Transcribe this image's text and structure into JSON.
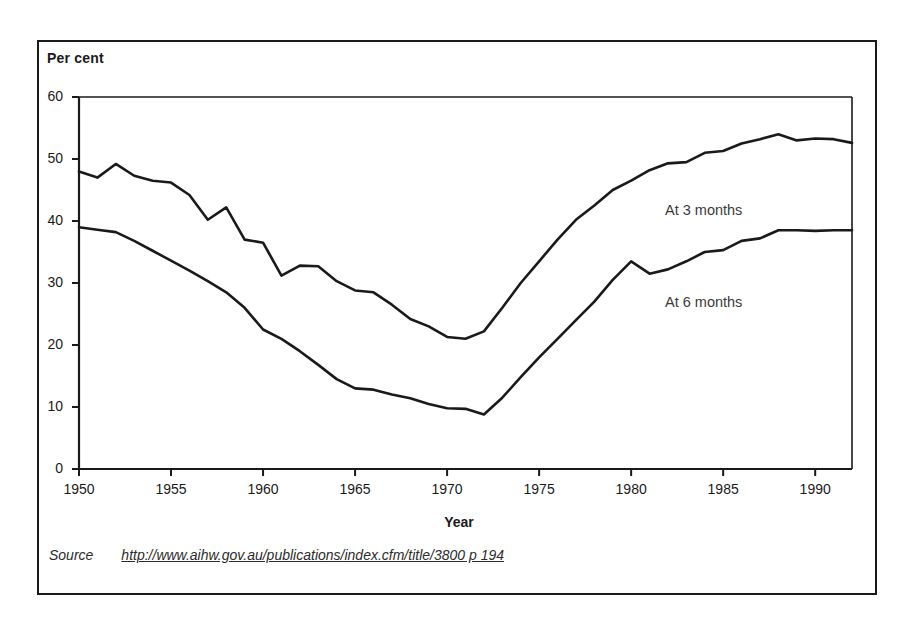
{
  "figure": {
    "y_axis_unit_label": "Per cent",
    "x_axis_title": "Year",
    "source_label": "Source",
    "source_url": "http://www.aihw.gov.au/publications/index.cfm/title/3800 p 194"
  },
  "annotations": {
    "series_3_months": "At 3 months",
    "series_6_months": "At 6 months"
  },
  "colors": {
    "line": "#1a1a1a",
    "axis": "#1a1a1a",
    "frame": "#1a1a1a",
    "background": "#ffffff",
    "annotation_text": "#3a3a3a"
  },
  "chart_data": {
    "type": "line",
    "title": "",
    "subtitle": "",
    "xlabel": "Year",
    "ylabel": "Per cent",
    "xlim": [
      1950,
      1992
    ],
    "ylim": [
      0,
      60
    ],
    "yticks": [
      0,
      10,
      20,
      30,
      40,
      50,
      60
    ],
    "xticks": [
      1950,
      1955,
      1960,
      1965,
      1970,
      1975,
      1980,
      1985,
      1990
    ],
    "grid": false,
    "legend_position": "inline-annotation",
    "x": [
      1950,
      1951,
      1952,
      1953,
      1954,
      1955,
      1956,
      1957,
      1958,
      1959,
      1960,
      1961,
      1962,
      1963,
      1964,
      1965,
      1966,
      1967,
      1968,
      1969,
      1970,
      1971,
      1972,
      1973,
      1974,
      1975,
      1976,
      1977,
      1978,
      1979,
      1980,
      1981,
      1982,
      1983,
      1984,
      1985,
      1986,
      1987,
      1988,
      1989,
      1990,
      1991,
      1992
    ],
    "series": [
      {
        "name": "At 3 months",
        "values": [
          48.0,
          47.0,
          49.2,
          47.3,
          46.5,
          46.2,
          44.2,
          40.2,
          42.2,
          37.0,
          36.5,
          31.2,
          32.8,
          32.7,
          30.3,
          28.8,
          28.5,
          26.5,
          24.2,
          23.0,
          21.3,
          21.0,
          22.2,
          26.0,
          30.0,
          33.5,
          37.0,
          40.2,
          42.5,
          45.0,
          46.5,
          48.2,
          49.3,
          49.5,
          51.0,
          51.3,
          52.5,
          53.2,
          54.0,
          53.0,
          53.3,
          53.2,
          52.6
        ]
      },
      {
        "name": "At 6 months",
        "values": [
          39.0,
          38.6,
          38.2,
          36.8,
          35.2,
          33.6,
          32.0,
          30.3,
          28.5,
          26.0,
          22.5,
          21.0,
          19.0,
          16.8,
          14.5,
          13.0,
          12.8,
          12.0,
          11.4,
          10.5,
          9.8,
          9.7,
          8.8,
          11.5,
          14.8,
          18.0,
          21.0,
          24.0,
          27.0,
          30.5,
          33.5,
          31.5,
          32.2,
          33.5,
          35.0,
          35.3,
          36.8,
          37.2,
          38.5,
          38.5,
          38.4,
          38.5,
          38.5
        ]
      }
    ]
  }
}
